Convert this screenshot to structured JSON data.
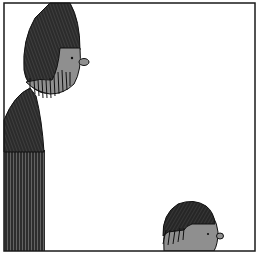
{
  "panel": {
    "description": "Single comic panel: tall bearded figure on left looking down at a small figure peeking up from bottom edge",
    "colors": {
      "ink": "#1a1a1a",
      "skin": "#8f8f8f",
      "background": "#ffffff",
      "hatch_dark": "#2a2a2a"
    }
  },
  "figures": [
    {
      "name": "tall-figure",
      "label": "Tall figure with hood/hair and beard"
    },
    {
      "name": "small-figure",
      "label": "Small figure head peeking from bottom"
    }
  ]
}
